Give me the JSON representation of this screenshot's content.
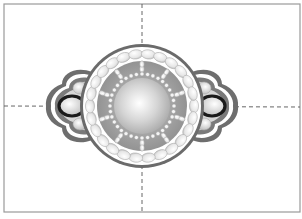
{
  "figure": {
    "title": "Beaded medallion connector design",
    "caption": "",
    "frame": {
      "x": 4,
      "y": 4,
      "width": 296,
      "height": 208,
      "stroke": "#9a9a9a"
    },
    "guides": {
      "vertical_x": 142,
      "horizontal_y": 106,
      "stroke": "#555555",
      "dash": "4,3"
    },
    "medallion": {
      "center": [
        142,
        106
      ],
      "outer_ring_radius": 62,
      "outer_ring_color": "#6b6b6b",
      "bead_ring_radius": 52,
      "bead_ring_count": 26,
      "inner_disc_radius": 44,
      "inner_disc_color": "#9e9e9e",
      "small_bead_ring_radius": 32,
      "small_bead_count": 36,
      "center_sphere_radius": 28,
      "spoke_count": 10
    },
    "side_links": [
      {
        "side": "left",
        "center": [
          72,
          106
        ],
        "rx": 13,
        "ry": 10,
        "ring_color": "#1a1a1a"
      },
      {
        "side": "right",
        "center": [
          212,
          106
        ],
        "rx": 13,
        "ry": 10,
        "ring_color": "#1a1a1a"
      }
    ],
    "colors": {
      "bead_fill": "#f2f2f2",
      "bead_stroke": "#b0b0b0",
      "wing_dark": "#6e6e6e",
      "wing_light": "#d8d8d8"
    }
  }
}
